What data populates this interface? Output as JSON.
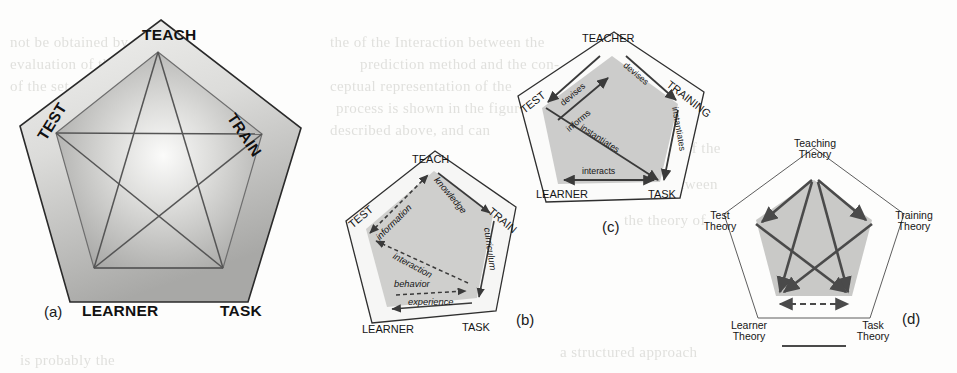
{
  "figure": {
    "background_color": "#fdfdfc",
    "ink_color": "#1a1a1a",
    "shade_light": "#e8e8e6",
    "shade_mid": "#c4c4c2",
    "shade_dark": "#9a9a98"
  },
  "background_bleed": [
    {
      "text": "the   of the  Interaction  between the",
      "x": 330,
      "y": 34
    },
    {
      "text": "prediction  method  and  the  con-",
      "x": 360,
      "y": 56
    },
    {
      "text": "ceptual  representation  of  the",
      "x": 330,
      "y": 78
    },
    {
      "text": "process  is  shown   in  the  figure",
      "x": 336,
      "y": 100
    },
    {
      "text": "described  above, and  can",
      "x": 330,
      "y": 122
    },
    {
      "text": "not  be  obtained   by   the",
      "x": 10,
      "y": 34
    },
    {
      "text": "evaluation  of  the  model",
      "x": 10,
      "y": 56
    },
    {
      "text": "of  the  set  of  theories",
      "x": 10,
      "y": 78
    },
    {
      "text": "the  structure  of  the",
      "x": 600,
      "y": 140
    },
    {
      "text": "relation  between",
      "x": 612,
      "y": 176
    },
    {
      "text": "the  theory  of",
      "x": 624,
      "y": 212
    },
    {
      "text": "is  probably  the",
      "x": 20,
      "y": 352
    },
    {
      "text": "a  structured  approach",
      "x": 560,
      "y": 344
    }
  ],
  "panels": [
    {
      "id": "a",
      "caption": "(a)",
      "title": "pentagon with inscribed pentagram",
      "nodes": [
        {
          "key": "teach",
          "label": "TEACH",
          "position": "top"
        },
        {
          "key": "test",
          "label": "TEST",
          "position": "upper-left"
        },
        {
          "key": "train",
          "label": "TRAIN",
          "position": "upper-right"
        },
        {
          "key": "learner",
          "label": "LEARNER",
          "position": "lower-left"
        },
        {
          "key": "task",
          "label": "TASK",
          "position": "lower-right"
        }
      ]
    },
    {
      "id": "b",
      "caption": "(b)",
      "title": "pentagon with labelled information flows",
      "nodes": [
        {
          "key": "teach",
          "label": "TEACH",
          "position": "top"
        },
        {
          "key": "test",
          "label": "TEST",
          "position": "upper-left"
        },
        {
          "key": "train",
          "label": "TRAIN",
          "position": "upper-right"
        },
        {
          "key": "learner",
          "label": "LEARNER",
          "position": "lower-left"
        },
        {
          "key": "task",
          "label": "TASK",
          "position": "lower-right"
        }
      ],
      "edges": [
        {
          "label": "information",
          "from": "test",
          "to": "teach",
          "style": "dashed",
          "arrow": "double"
        },
        {
          "label": "knowledge",
          "from": "teach",
          "to": "train",
          "style": "solid",
          "arrow": "single"
        },
        {
          "label": "curriculum",
          "from": "train",
          "to": "task",
          "style": "solid",
          "arrow": "single"
        },
        {
          "label": "experience",
          "from": "task",
          "to": "learner",
          "style": "solid",
          "arrow": "single"
        },
        {
          "label": "behavior",
          "from": "learner",
          "to": "task",
          "style": "dashed",
          "arrow": "single"
        },
        {
          "label": "interaction",
          "from": "task",
          "to": "test",
          "style": "dashed",
          "arrow": "single"
        }
      ]
    },
    {
      "id": "c",
      "caption": "(c)",
      "title": "pentagon with relational verbs",
      "nodes": [
        {
          "key": "teacher",
          "label": "TEACHER",
          "position": "top"
        },
        {
          "key": "test",
          "label": "TEST",
          "position": "upper-left"
        },
        {
          "key": "training",
          "label": "TRAINING",
          "position": "upper-right"
        },
        {
          "key": "learner",
          "label": "LEARNER",
          "position": "lower-left"
        },
        {
          "key": "task",
          "label": "TASK",
          "position": "lower-right"
        }
      ],
      "edges": [
        {
          "label": "devises",
          "from": "teacher",
          "to": "test",
          "style": "solid",
          "arrow": "single"
        },
        {
          "label": "devises",
          "from": "teacher",
          "to": "training",
          "style": "solid",
          "arrow": "single"
        },
        {
          "label": "informs",
          "from": "test",
          "to": "teacher",
          "style": "solid",
          "arrow": "single"
        },
        {
          "label": "instantiates",
          "from": "test",
          "to": "task",
          "style": "solid",
          "arrow": "single"
        },
        {
          "label": "instantiates",
          "from": "training",
          "to": "task",
          "style": "solid",
          "arrow": "single"
        },
        {
          "label": "interacts",
          "from": "learner",
          "to": "task",
          "style": "solid",
          "arrow": "double"
        }
      ]
    },
    {
      "id": "d",
      "caption": "(d)",
      "title": "pentagon of theories",
      "nodes": [
        {
          "key": "teaching",
          "label_line1": "Teaching",
          "label_line2": "Theory",
          "position": "top"
        },
        {
          "key": "test",
          "label_line1": "Test",
          "label_line2": "Theory",
          "position": "upper-left"
        },
        {
          "key": "training",
          "label_line1": "Training",
          "label_line2": "Theory",
          "position": "upper-right"
        },
        {
          "key": "learner",
          "label_line1": "Learner",
          "label_line2": "Theory",
          "position": "lower-left"
        },
        {
          "key": "task",
          "label_line1": "Task",
          "label_line2": "Theory",
          "position": "lower-right"
        }
      ],
      "edges": [
        {
          "from": "teaching",
          "to": "test",
          "style": "solid",
          "arrow": "single"
        },
        {
          "from": "teaching",
          "to": "training",
          "style": "solid",
          "arrow": "single"
        },
        {
          "from": "teaching",
          "to": "learner",
          "style": "solid",
          "arrow": "single"
        },
        {
          "from": "teaching",
          "to": "task",
          "style": "solid",
          "arrow": "single"
        },
        {
          "from": "test",
          "to": "task",
          "style": "solid",
          "arrow": "single"
        },
        {
          "from": "training",
          "to": "learner",
          "style": "solid",
          "arrow": "single"
        },
        {
          "from": "learner",
          "to": "task",
          "style": "dashed",
          "arrow": "double"
        }
      ]
    }
  ]
}
